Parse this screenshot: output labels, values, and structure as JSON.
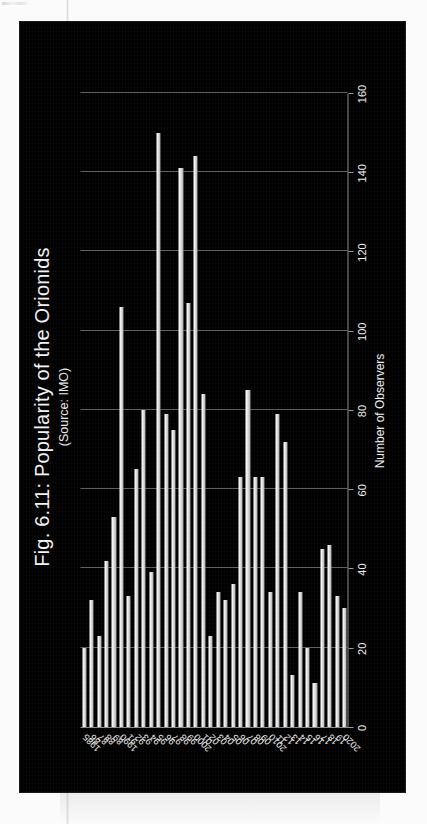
{
  "figure": {
    "title": "Fig. 6.11: Popularity of the Orionids",
    "subtitle": "(Source: IMO)"
  },
  "chart_data": {
    "type": "bar",
    "orientation": "horizontal",
    "title": "Fig. 6.11: Popularity of the Orionids",
    "subtitle": "(Source: IMO)",
    "xlabel": "",
    "ylabel": "Number of Observers",
    "value_axis_label": "Number of Observers",
    "value_ticks": [
      "0",
      "20",
      "40",
      "60",
      "80",
      "100",
      "120",
      "140",
      "160"
    ],
    "value_tick_values": [
      0,
      20,
      40,
      60,
      80,
      100,
      120,
      140,
      160
    ],
    "xlim": [
      0,
      160
    ],
    "grid": true,
    "legend": "none",
    "bar_color": "#f0f0f0",
    "background_color": "#000000",
    "text_color": "#f2f2f2",
    "categories": [
      "1985",
      "86",
      "87",
      "88",
      "89",
      "1990",
      "91",
      "92",
      "93",
      "94",
      "95",
      "96",
      "97",
      "98",
      "99",
      "2000",
      "01",
      "02",
      "03",
      "04",
      "05",
      "06",
      "07",
      "08",
      "09",
      "2010",
      "11",
      "12",
      "13",
      "14",
      "15",
      "16",
      "17",
      "18",
      "19",
      "2020"
    ],
    "values": [
      20,
      32,
      23,
      42,
      53,
      106,
      33,
      65,
      80,
      39,
      150,
      79,
      75,
      141,
      107,
      144,
      84,
      23,
      34,
      32,
      36,
      63,
      85,
      63,
      63,
      34,
      79,
      72,
      13,
      34,
      20,
      11,
      45,
      46,
      33,
      30
    ]
  }
}
